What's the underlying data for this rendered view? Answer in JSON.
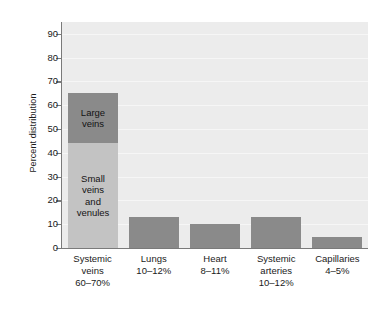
{
  "chart_data": {
    "type": "bar",
    "title": "",
    "xlabel": "",
    "ylabel": "Percent distribution",
    "ylim": [
      0,
      95
    ],
    "yticks": [
      0,
      10,
      20,
      30,
      40,
      50,
      60,
      70,
      80,
      90
    ],
    "grid": true,
    "legend": "none",
    "stacked_first_bar": true,
    "categories": [
      "Systemic veins",
      "Lungs",
      "Heart",
      "Systemic arteries",
      "Capillaries"
    ],
    "category_labels": [
      {
        "name": "Systemic",
        "name2": "veins",
        "range": "60–70%"
      },
      {
        "name": "Lungs",
        "name2": "",
        "range": "10–12%"
      },
      {
        "name": "Heart",
        "name2": "",
        "range": "8–11%"
      },
      {
        "name": "Systemic",
        "name2": "arteries",
        "range": "10–12%"
      },
      {
        "name": "Capillaries",
        "name2": "",
        "range": "4–5%"
      }
    ],
    "values": [
      65,
      13,
      10,
      13,
      4.5
    ],
    "segments": [
      {
        "category": "Systemic veins",
        "label": "Small veins and venules",
        "label_lines": [
          "Small",
          "veins",
          "and",
          "venules"
        ],
        "from": 0,
        "to": 44,
        "color": "#c3c3c3"
      },
      {
        "category": "Systemic veins",
        "label": "Large veins",
        "label_lines": [
          "Large",
          "veins"
        ],
        "from": 44,
        "to": 65,
        "color": "#8a8a8a"
      },
      {
        "category": "Lungs",
        "label": "",
        "label_lines": [],
        "from": 0,
        "to": 13,
        "color": "#8a8a8a"
      },
      {
        "category": "Heart",
        "label": "",
        "label_lines": [],
        "from": 0,
        "to": 10,
        "color": "#8a8a8a"
      },
      {
        "category": "Systemic arteries",
        "label": "",
        "label_lines": [],
        "from": 0,
        "to": 13,
        "color": "#8a8a8a"
      },
      {
        "category": "Capillaries",
        "label": "",
        "label_lines": [],
        "from": 0,
        "to": 4.5,
        "color": "#8a8a8a"
      }
    ],
    "colors": {
      "plot_background": "#ececec",
      "gridline": "#f6f6f6",
      "axis": "#7a7a7a",
      "bar_dark": "#8a8a8a",
      "bar_light": "#c3c3c3",
      "text": "#1a1a1a",
      "page_background": "#ffffff"
    }
  }
}
